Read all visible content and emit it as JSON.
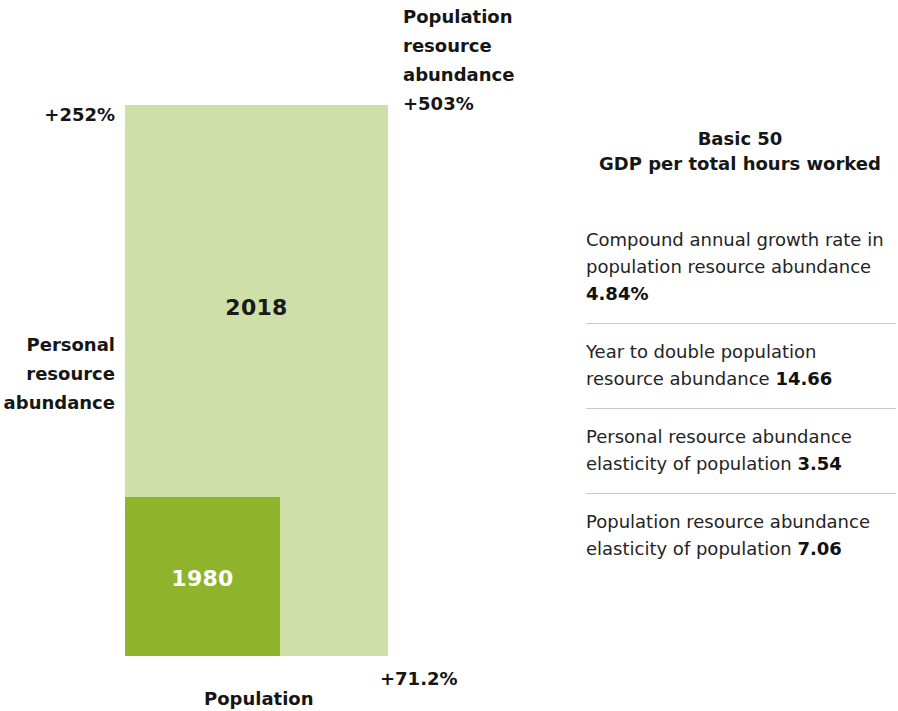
{
  "chart_data": {
    "type": "bar",
    "subtitle": "Population resource abundance, 1980 vs 2018",
    "xlabel": "Population",
    "ylabel": "Personal resource abundance",
    "categories": [
      "1980",
      "2018"
    ],
    "series": [
      {
        "name": "Population (width)",
        "values": [
          1,
          1.712
        ],
        "labels": [
          "",
          "+71.2%"
        ]
      },
      {
        "name": "Personal resource abundance (height)",
        "values": [
          1,
          3.52
        ],
        "labels": [
          "",
          "+252%"
        ]
      },
      {
        "name": "Population resource abundance (area)",
        "values": [
          1,
          6.03
        ],
        "labels": [
          "",
          "+503%"
        ]
      }
    ],
    "rects": [
      {
        "name": "1980",
        "x": 0,
        "y": 0,
        "width": 1,
        "height": 1,
        "color": "#8fb42c"
      },
      {
        "name": "2018",
        "x": 0,
        "y": 0,
        "width": 1.712,
        "height": 3.52,
        "color": "#cfdfa8"
      }
    ],
    "annotations": [
      {
        "position": "left-top",
        "text": "+252%"
      },
      {
        "position": "left-middle",
        "text": "Personal resource abundance"
      },
      {
        "position": "top-right",
        "text": "Population resource abundance +503%"
      },
      {
        "position": "bottom-right",
        "text": "+71.2%"
      },
      {
        "position": "bottom-center",
        "text": "Population"
      }
    ],
    "grid": false,
    "legend": "none"
  },
  "chart": {
    "rect_2018_label": "2018",
    "rect_1980_label": "1980",
    "left_percent": "+252%",
    "left_axis_label": "Personal\nresource\nabundance",
    "left_axis_line1": "Personal",
    "left_axis_line2": "resource",
    "left_axis_line3": "abundance",
    "top_right_line1": "Population",
    "top_right_line2": "resource",
    "top_right_line3": "abundance",
    "top_right_value": "+503%",
    "bottom_percent": "+71.2%",
    "bottom_label": "Population",
    "color_outer": "#cfdfa8",
    "color_inner": "#8fb42c"
  },
  "panel": {
    "title_line1": "Basic 50",
    "title_line2": "GDP per total hours worked",
    "stats": [
      {
        "text": "Compound annual growth rate in population resource abundance ",
        "value": "4.84%"
      },
      {
        "text": "Year to double population resource abundance ",
        "value": "14.66"
      },
      {
        "text": "Personal resource abundance elasticity of population ",
        "value": "3.54"
      },
      {
        "text": "Population resource abundance elasticity of population ",
        "value": "7.06"
      }
    ]
  }
}
